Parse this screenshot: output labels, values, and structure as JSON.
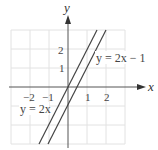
{
  "graph": {
    "x_axis_label": "x",
    "y_axis_label": "y",
    "x_tick_labels": [
      "−2",
      "−1",
      "1",
      "2"
    ],
    "y_tick_labels": [
      "1",
      "2"
    ],
    "grid_range": {
      "x": [
        -3,
        3
      ],
      "y": [
        -3,
        3
      ]
    },
    "lines": [
      {
        "equation": "y = 2x",
        "label": "y = 2x",
        "slope": 2,
        "intercept": 0
      },
      {
        "equation": "y = 2x − 1",
        "label": "y = 2x − 1",
        "slope": 2,
        "intercept": -1
      }
    ],
    "colors": {
      "grid": "#e4e4e4",
      "axis": "#555555",
      "line": "#444444"
    }
  }
}
